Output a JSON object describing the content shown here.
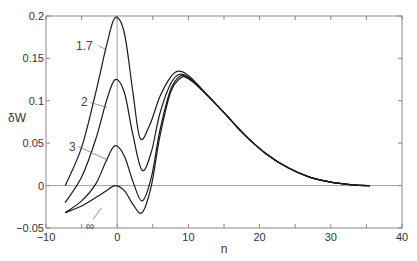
{
  "chart_data": {
    "type": "line",
    "title": "",
    "xlabel": "n",
    "ylabel": "δW",
    "xlim": [
      -10,
      40
    ],
    "ylim": [
      -0.05,
      0.2
    ],
    "xticks": [
      -10,
      0,
      10,
      20,
      30,
      40
    ],
    "xtick_labels": [
      "−10",
      "0",
      "10",
      "20",
      "30",
      "40"
    ],
    "yticks": [
      -0.05,
      0,
      0.05,
      0.1,
      0.15,
      0.2
    ],
    "ytick_labels": [
      "−0.05",
      "0",
      "0.05",
      "0.1",
      "0.15",
      "0.2"
    ],
    "grid": false,
    "reference_lines": [
      {
        "orientation": "horizontal",
        "value": 0
      },
      {
        "orientation": "vertical",
        "value": 0
      }
    ],
    "legend": "inline labels",
    "series": [
      {
        "name": "1.7",
        "label": "1.7",
        "x": [
          -7.3,
          -5,
          -3,
          -1.5,
          -0.3,
          1,
          2.2,
          3.2,
          4.5,
          6,
          7.5,
          8.6,
          10,
          12,
          15,
          18,
          21,
          24,
          27,
          30,
          33,
          35.5
        ],
        "y": [
          0.0,
          0.045,
          0.11,
          0.165,
          0.198,
          0.18,
          0.11,
          0.056,
          0.07,
          0.105,
          0.128,
          0.135,
          0.13,
          0.113,
          0.086,
          0.059,
          0.037,
          0.021,
          0.01,
          0.004,
          0.001,
          0.0
        ]
      },
      {
        "name": "2",
        "label": "2",
        "x": [
          -7.3,
          -5,
          -3,
          -1.5,
          -0.3,
          1,
          2.2,
          3.5,
          4.8,
          6,
          7.5,
          8.7,
          10,
          12,
          15,
          18,
          21,
          24,
          27,
          30,
          33,
          35.5
        ],
        "y": [
          -0.02,
          0.01,
          0.055,
          0.1,
          0.125,
          0.11,
          0.06,
          0.018,
          0.04,
          0.085,
          0.12,
          0.131,
          0.128,
          0.112,
          0.086,
          0.059,
          0.037,
          0.021,
          0.01,
          0.004,
          0.001,
          0.0
        ]
      },
      {
        "name": "3",
        "label": "3",
        "x": [
          -7.3,
          -5,
          -3,
          -1.5,
          -0.3,
          1,
          2.2,
          3.5,
          4.8,
          6,
          7.5,
          8.8,
          10,
          12,
          15,
          18,
          21,
          24,
          27,
          30,
          33,
          35.5
        ],
        "y": [
          -0.032,
          -0.018,
          0.002,
          0.03,
          0.047,
          0.035,
          0.005,
          -0.018,
          0.01,
          0.065,
          0.113,
          0.129,
          0.127,
          0.112,
          0.086,
          0.059,
          0.037,
          0.021,
          0.01,
          0.004,
          0.001,
          0.0
        ]
      },
      {
        "name": "∞",
        "label": "∞",
        "x": [
          -7.3,
          -5,
          -3,
          -1.5,
          -0.3,
          1,
          2.2,
          3.5,
          4.8,
          6,
          7.5,
          8.9,
          10,
          12,
          15,
          18,
          21,
          24,
          27,
          30,
          33,
          35.5
        ],
        "y": [
          -0.032,
          -0.024,
          -0.014,
          -0.006,
          0.0,
          -0.006,
          -0.022,
          -0.032,
          0.0,
          0.058,
          0.11,
          0.127,
          0.126,
          0.112,
          0.086,
          0.059,
          0.037,
          0.021,
          0.01,
          0.004,
          0.001,
          0.0
        ]
      }
    ],
    "annotations": [
      {
        "text": "1.7",
        "x": -4.6,
        "y": 0.165
      },
      {
        "text": "2",
        "x": -4.6,
        "y": 0.098
      },
      {
        "text": "3",
        "x": -6.3,
        "y": 0.046
      },
      {
        "text": "∞",
        "x": -3.8,
        "y": -0.048
      }
    ]
  },
  "layout": {
    "plot_px": {
      "left": 46,
      "top": 16,
      "right": 402,
      "bottom": 228
    },
    "line_color": "#1a1a1a",
    "axis_color": "#888888"
  }
}
